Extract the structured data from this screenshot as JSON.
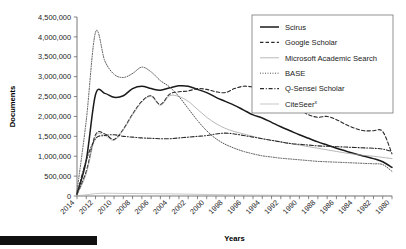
{
  "chart_data": {
    "type": "line",
    "title": "",
    "xlabel": "Years",
    "ylabel": "Documents",
    "ylim": [
      0,
      4500000
    ],
    "ytick_values": [
      0,
      500000,
      1000000,
      1500000,
      2000000,
      2500000,
      3000000,
      3500000,
      4000000,
      4500000
    ],
    "ytick_labels": [
      "0",
      "500,000",
      "1,000,000",
      "1,500,000",
      "2,000,000",
      "2,500,000",
      "3,000,000",
      "3,500,000",
      "4,000,000",
      "4,500,000"
    ],
    "x_axis_reversed": true,
    "x": [
      2014,
      2013,
      2012,
      2011,
      2010,
      2009,
      2008,
      2007,
      2006,
      2005,
      2004,
      2003,
      2002,
      2001,
      2000,
      1999,
      1998,
      1997,
      1996,
      1995,
      1994,
      1993,
      1992,
      1991,
      1990,
      1989,
      1988,
      1987,
      1986,
      1985,
      1984,
      1983,
      1982,
      1981,
      1980
    ],
    "xtick_labels": [
      "2014",
      "2012",
      "2010",
      "2008",
      "2006",
      "2004",
      "2002",
      "2000",
      "1998",
      "1996",
      "1994",
      "1992",
      "1990",
      "1988",
      "1986",
      "1984",
      "1982",
      "1980"
    ],
    "grid": false,
    "legend_position": "top-right",
    "series": [
      {
        "name": "Scirus",
        "style": "solid",
        "width": 1.5,
        "color": "#1a1a1a",
        "values": [
          60000,
          900000,
          2550000,
          2580000,
          2480000,
          2520000,
          2700000,
          2760000,
          2700000,
          2660000,
          2720000,
          2770000,
          2760000,
          2680000,
          2600000,
          2480000,
          2380000,
          2280000,
          2160000,
          2040000,
          1960000,
          1850000,
          1740000,
          1640000,
          1540000,
          1450000,
          1360000,
          1280000,
          1200000,
          1130000,
          1060000,
          1000000,
          940000,
          860000,
          720000
        ]
      },
      {
        "name": "Google Scholar",
        "style": "dashed",
        "width": 1.1,
        "color": "#2a2a2a",
        "values": [
          40000,
          620000,
          1540000,
          1560000,
          1420000,
          1680000,
          2060000,
          2380000,
          2520000,
          2300000,
          2560000,
          2620000,
          2640000,
          2700000,
          2680000,
          2620000,
          2600000,
          2700000,
          2760000,
          2740000,
          2700000,
          2600000,
          2500000,
          2340000,
          2180000,
          2040000,
          1980000,
          2000000,
          1920000,
          1800000,
          1700000,
          1640000,
          1640000,
          1620000,
          1060000
        ]
      },
      {
        "name": "Microsoft Academic Search",
        "style": "solid",
        "width": 0.7,
        "color": "#9a9a9a",
        "values": [
          30000,
          560000,
          1500000,
          1520000,
          1400000,
          1660000,
          2040000,
          2360000,
          2500000,
          2280000,
          2520000,
          2500000,
          2380000,
          2180000,
          1980000,
          1820000,
          1700000,
          1620000,
          1560000,
          1500000,
          1440000,
          1400000,
          1360000,
          1320000,
          1280000,
          1240000,
          1200000,
          1160000,
          1120000,
          1080000,
          1050000,
          1020000,
          1000000,
          970000,
          940000
        ]
      },
      {
        "name": "BASE",
        "style": "dotted",
        "width": 1.0,
        "color": "#555555",
        "values": [
          120000,
          1900000,
          4120000,
          3400000,
          3060000,
          2980000,
          3080000,
          3240000,
          3120000,
          2900000,
          2740000,
          2500000,
          2200000,
          1900000,
          1640000,
          1440000,
          1300000,
          1200000,
          1120000,
          1060000,
          1010000,
          980000,
          950000,
          930000,
          910000,
          890000,
          870000,
          860000,
          850000,
          840000,
          830000,
          820000,
          810000,
          790000,
          620000
        ]
      },
      {
        "name": "Q-Sensei Scholar",
        "style": "dashdot",
        "width": 1.1,
        "color": "#2a2a2a",
        "values": [
          40000,
          900000,
          1440000,
          1520000,
          1540000,
          1500000,
          1480000,
          1460000,
          1450000,
          1440000,
          1440000,
          1460000,
          1480000,
          1500000,
          1520000,
          1560000,
          1580000,
          1560000,
          1520000,
          1480000,
          1440000,
          1400000,
          1360000,
          1320000,
          1300000,
          1280000,
          1260000,
          1250000,
          1240000,
          1230000,
          1220000,
          1210000,
          1200000,
          1180000,
          1120000
        ]
      },
      {
        "name": "CiteSeer",
        "name_suffix": "x",
        "style": "solid",
        "width": 0.7,
        "color": "#b0b0b0",
        "values": [
          8000,
          30000,
          60000,
          70000,
          68000,
          64000,
          62000,
          60000,
          58000,
          56000,
          54000,
          50000,
          46000,
          42000,
          38000,
          34000,
          30000,
          28000,
          26000,
          24000,
          22000,
          20000,
          18000,
          17000,
          16000,
          15000,
          14000,
          13000,
          12000,
          11000,
          10000,
          9000,
          8000,
          7000,
          6000
        ]
      }
    ]
  },
  "legend": {
    "entries": [
      {
        "label": "Scirus"
      },
      {
        "label": "Google Scholar"
      },
      {
        "label": "Microsoft Academic Search"
      },
      {
        "label": "BASE"
      },
      {
        "label": "Q-Sensei Scholar"
      },
      {
        "label": "CiteSeer",
        "superscript": "x"
      }
    ]
  }
}
